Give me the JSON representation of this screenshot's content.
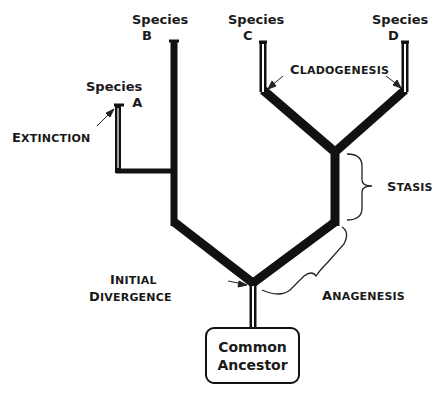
{
  "diagram": {
    "type": "phylogenetic-tree",
    "root": {
      "label": "Common Ancestor"
    },
    "species": [
      {
        "id": "A",
        "label_top": "Species",
        "label_letter": "A"
      },
      {
        "id": "B",
        "label_top": "Species",
        "label_letter": "B"
      },
      {
        "id": "C",
        "label_top": "Species",
        "label_letter": "C"
      },
      {
        "id": "D",
        "label_top": "Species",
        "label_letter": "D"
      }
    ],
    "annotations": {
      "extinction": {
        "first": "E",
        "rest": "XTINCTION"
      },
      "cladogenesis": {
        "first": "C",
        "rest": "LADOGENESIS"
      },
      "stasis": {
        "first": "S",
        "rest": "TASIS"
      },
      "initial_line1": {
        "first": "I",
        "rest": "NITIAL"
      },
      "initial_line2": {
        "first": "D",
        "rest": "IVERGENCE"
      },
      "anagenesis": {
        "first": "A",
        "rest": "NAGENESIS"
      }
    },
    "colors": {
      "line": "#111111",
      "background": "#ffffff",
      "text": "#1a1a1a"
    }
  }
}
